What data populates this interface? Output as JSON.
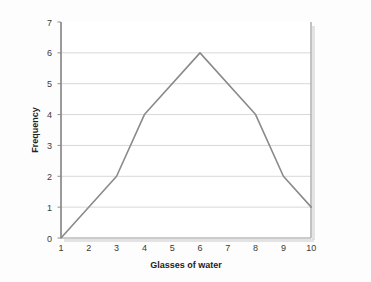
{
  "figure": {
    "background_color": "#fdfdfd",
    "frame_color": "#9a9a9a",
    "shadow_color": "#cfcfcf"
  },
  "chart_data": {
    "type": "line",
    "title": "",
    "subtitle": "",
    "xlabel": "Glasses of water",
    "ylabel": "Frequency",
    "x": [
      1,
      3,
      4,
      6,
      8,
      9,
      10
    ],
    "values": [
      0,
      2,
      4,
      6,
      4,
      2,
      1
    ],
    "series": [
      {
        "name": "Frequency",
        "color": "#8a8a8a",
        "points": [
          {
            "x": 1,
            "y": 0
          },
          {
            "x": 3,
            "y": 2
          },
          {
            "x": 4,
            "y": 4
          },
          {
            "x": 6,
            "y": 6
          },
          {
            "x": 8,
            "y": 4
          },
          {
            "x": 9,
            "y": 2
          },
          {
            "x": 10,
            "y": 1
          }
        ]
      }
    ],
    "xlim": [
      1,
      10
    ],
    "ylim": [
      0,
      7
    ],
    "xticks": [
      1,
      2,
      3,
      4,
      5,
      6,
      7,
      8,
      9,
      10
    ],
    "yticks": [
      0,
      1,
      2,
      3,
      4,
      5,
      6,
      7
    ],
    "xtick_labels": [
      "1",
      "2",
      "3",
      "4",
      "5",
      "6",
      "7",
      "8",
      "9",
      "10"
    ],
    "ytick_labels": [
      "0",
      "1",
      "2",
      "3",
      "4",
      "5",
      "6",
      "7"
    ],
    "grid": {
      "horizontal": true,
      "vertical": false,
      "color": "#d8d8d8"
    },
    "legend": {
      "visible": false,
      "position": "none"
    },
    "annotations": [],
    "line_color": "#8a8a8a",
    "line_width": 1.6,
    "markers": false
  }
}
